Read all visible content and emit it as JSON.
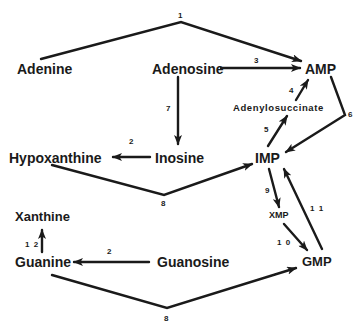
{
  "diagram": {
    "type": "purine-salvage-pathway",
    "nodes": {
      "adenine": "Adenine",
      "adenosine": "Adenosine",
      "amp": "AMP",
      "adenylosuccinate": "Adenylosuccinate",
      "hypoxanthine": "Hypoxanthine",
      "inosine": "Inosine",
      "imp": "IMP",
      "xmp": "XMP",
      "xanthine": "Xanthine",
      "guanine": "Guanine",
      "guanosine": "Guanosine",
      "gmp": "GMP"
    },
    "edge_labels": {
      "adenine_to_amp": "1",
      "inosine_to_hypoxanthine": "2",
      "guanosine_to_guanine": "2",
      "adenosine_to_amp": "3",
      "adenylosuccinate_to_amp": "4",
      "imp_to_adenylosuccinate": "5",
      "amp_to_imp": "6",
      "adenosine_to_inosine": "7",
      "hypoxanthine_to_imp": "8",
      "guanine_to_gmp": "8",
      "imp_to_xmp": "9",
      "xmp_to_gmp": "1 0",
      "gmp_to_imp": "1 1",
      "guanine_to_xanthine": "1 2"
    },
    "edges": [
      {
        "from": "Adenine",
        "to": "AMP",
        "label": "1"
      },
      {
        "from": "Adenosine",
        "to": "AMP",
        "label": "3"
      },
      {
        "from": "Adenylosuccinate",
        "to": "AMP",
        "label": "4"
      },
      {
        "from": "IMP",
        "to": "Adenylosuccinate",
        "label": "5"
      },
      {
        "from": "AMP",
        "to": "IMP",
        "label": "6"
      },
      {
        "from": "Adenosine",
        "to": "Inosine",
        "label": "7"
      },
      {
        "from": "Inosine",
        "to": "Hypoxanthine",
        "label": "2"
      },
      {
        "from": "Hypoxanthine",
        "to": "IMP",
        "label": "8"
      },
      {
        "from": "IMP",
        "to": "XMP",
        "label": "9"
      },
      {
        "from": "XMP",
        "to": "GMP",
        "label": "10"
      },
      {
        "from": "GMP",
        "to": "IMP",
        "label": "11"
      },
      {
        "from": "Guanine",
        "to": "Xanthine",
        "label": "12"
      },
      {
        "from": "Guanosine",
        "to": "Guanine",
        "label": "2"
      },
      {
        "from": "Guanine",
        "to": "GMP",
        "label": "8"
      }
    ]
  }
}
